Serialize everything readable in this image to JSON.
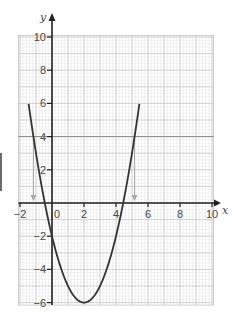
{
  "chart_data": {
    "type": "line",
    "title": "",
    "function": "y = x^2 - 4x - 2",
    "xlabel": "x",
    "ylabel": "y",
    "xlim": [
      -2,
      10
    ],
    "ylim": [
      -6,
      10
    ],
    "grid": true,
    "x_ticks": [
      -2,
      0,
      2,
      4,
      6,
      8,
      10
    ],
    "y_ticks": [
      -6,
      -4,
      -2,
      2,
      4,
      6,
      8,
      10
    ],
    "x_tick_labels": [
      "−2",
      "0",
      "2",
      "4",
      "6",
      "8",
      "10"
    ],
    "y_tick_labels": [
      "−6",
      "−4",
      "−2",
      "2",
      "4",
      "6",
      "8",
      "10"
    ],
    "series": [
      {
        "name": "y = x² − 4x − 2",
        "color": "#333333",
        "x": [
          -1.46,
          -1,
          0,
          1,
          2,
          3,
          4,
          5,
          5.46
        ],
        "y": [
          10,
          3,
          -2,
          -5,
          -6,
          -5,
          -2,
          3,
          10
        ]
      },
      {
        "name": "y = 4",
        "color": "#8a8a8a",
        "x": [
          -2.1,
          10.1
        ],
        "y": [
          4,
          4
        ]
      }
    ],
    "annotations": [
      {
        "type": "arrow-down",
        "x": -1.16,
        "from_y": 4,
        "to_y": 0,
        "color": "#a8a8a8"
      },
      {
        "type": "arrow-down",
        "x": 5.16,
        "from_y": 4,
        "to_y": 0,
        "color": "#a8a8a8"
      }
    ],
    "vertex": [
      2,
      -6
    ],
    "roots": [
      -0.45,
      4.45
    ],
    "intersections_with_y4": [
      -1.16,
      5.16
    ]
  },
  "colors": {
    "curve": "#333333",
    "axis": "#222222",
    "grid_major": "#c4c4c4",
    "grid_minor": "#e4e4e4",
    "hline": "#8a8a8a",
    "arrow": "#a8a8a8"
  }
}
